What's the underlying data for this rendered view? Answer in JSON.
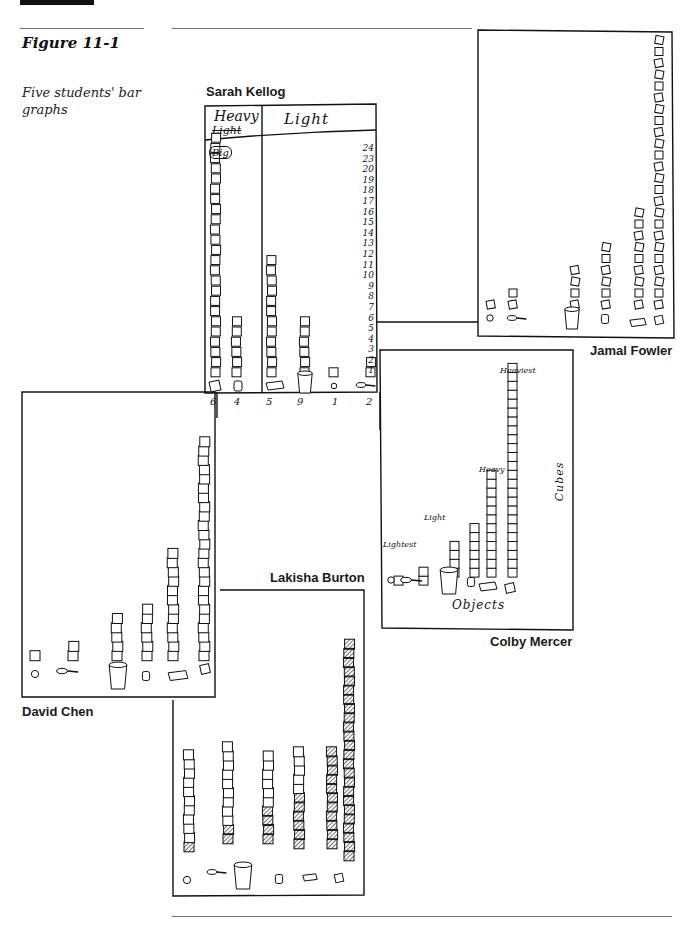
{
  "figure": {
    "number": "Figure 11-1",
    "caption": "Five students' bar graphs"
  },
  "students": {
    "sarah": {
      "name": "Sarah Kellog",
      "header_left": "Heavy",
      "header_left_struck": "Light",
      "header_right": "Light",
      "big_label": "Big",
      "scale_numbers": [
        "24",
        "23",
        "20",
        "19",
        "18",
        "17",
        "16",
        "15",
        "14",
        "13",
        "12",
        "11",
        "10",
        "9",
        "8",
        "7",
        "6",
        "5",
        "4",
        "3",
        "2",
        "1"
      ],
      "object_counts": [
        "6",
        "4",
        "5",
        "9",
        "1",
        "2"
      ]
    },
    "jamal": {
      "name": "Jamal Fowler"
    },
    "colby": {
      "name": "Colby Mercer",
      "labels": {
        "lightest": "Lightest",
        "light": "Light",
        "heavy": "Heavy",
        "heaviest": "Heaviest"
      },
      "x_axis": "Objects",
      "y_axis": "Cubes"
    },
    "david": {
      "name": "David Chen"
    },
    "lakisha": {
      "name": "Lakisha Burton"
    }
  },
  "chart_data": [
    {
      "type": "bar",
      "title": "Sarah Kellog",
      "categories": [
        "block",
        "film can",
        "chalk box",
        "cup",
        "ball",
        "spoon"
      ],
      "groups": [
        "Heavy",
        "Heavy",
        "Light",
        "Light",
        "Light",
        "Light"
      ],
      "values": [
        24,
        6,
        12,
        6,
        1,
        2
      ],
      "ylabel": "cubes",
      "ylim": [
        0,
        24
      ]
    },
    {
      "type": "bar",
      "title": "Jamal Fowler",
      "categories": [
        "ball",
        "spoon",
        "cup",
        "film can",
        "chalk box",
        "block"
      ],
      "values": [
        1,
        2,
        4,
        6,
        9,
        24
      ],
      "ylim": [
        0,
        24
      ]
    },
    {
      "type": "bar",
      "title": "Colby Mercer",
      "categories": [
        "ball",
        "spoon",
        "cup",
        "film can",
        "chalk box",
        "block"
      ],
      "values": [
        1,
        2,
        4,
        6,
        12,
        24
      ],
      "annotations": [
        "Lightest",
        "Light",
        "Heavy",
        "Heaviest"
      ],
      "xlabel": "Objects",
      "ylabel": "Cubes",
      "ylim": [
        0,
        24
      ]
    },
    {
      "type": "bar",
      "title": "David Chen",
      "categories": [
        "ball",
        "spoon",
        "cup",
        "film can",
        "chalk box",
        "block"
      ],
      "values": [
        1,
        2,
        5,
        6,
        12,
        24
      ],
      "ylim": [
        0,
        24
      ]
    },
    {
      "type": "bar",
      "title": "Lakisha Burton",
      "categories": [
        "ball",
        "spoon",
        "cup",
        "film can",
        "chalk box",
        "block"
      ],
      "series": [
        {
          "name": "plain cubes",
          "values": [
            10,
            9,
            6,
            5,
            0,
            0
          ]
        },
        {
          "name": "shaded cubes",
          "values": [
            1,
            2,
            4,
            6,
            11,
            24
          ]
        }
      ],
      "ylim": [
        0,
        24
      ]
    }
  ]
}
